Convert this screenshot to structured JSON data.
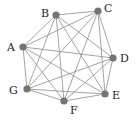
{
  "diagram": {
    "type": "complete-graph",
    "name": "K7",
    "colors": {
      "node": "#747474",
      "edge": "#9a9a9a",
      "label": "#222222",
      "background": "#ffffff"
    },
    "nodes": [
      {
        "id": "A",
        "label": "A",
        "x": 23,
        "y": 47,
        "lx": 7,
        "ly": 51
      },
      {
        "id": "B",
        "label": "B",
        "x": 56,
        "y": 15,
        "lx": 41,
        "ly": 17
      },
      {
        "id": "C",
        "label": "C",
        "x": 98,
        "y": 11,
        "lx": 104,
        "ly": 12
      },
      {
        "id": "D",
        "label": "D",
        "x": 113,
        "y": 58,
        "lx": 120,
        "ly": 62
      },
      {
        "id": "E",
        "label": "E",
        "x": 105,
        "y": 94,
        "lx": 112,
        "ly": 99
      },
      {
        "id": "F",
        "label": "F",
        "x": 64,
        "y": 101,
        "lx": 70,
        "ly": 114
      },
      {
        "id": "G",
        "label": "G",
        "x": 27,
        "y": 89,
        "lx": 9,
        "ly": 94
      }
    ],
    "edges": [
      [
        "A",
        "B"
      ],
      [
        "A",
        "C"
      ],
      [
        "A",
        "D"
      ],
      [
        "A",
        "E"
      ],
      [
        "A",
        "F"
      ],
      [
        "A",
        "G"
      ],
      [
        "B",
        "C"
      ],
      [
        "B",
        "D"
      ],
      [
        "B",
        "E"
      ],
      [
        "B",
        "F"
      ],
      [
        "B",
        "G"
      ],
      [
        "C",
        "D"
      ],
      [
        "C",
        "E"
      ],
      [
        "C",
        "F"
      ],
      [
        "C",
        "G"
      ],
      [
        "D",
        "E"
      ],
      [
        "D",
        "F"
      ],
      [
        "D",
        "G"
      ],
      [
        "E",
        "F"
      ],
      [
        "E",
        "G"
      ],
      [
        "F",
        "G"
      ]
    ]
  }
}
